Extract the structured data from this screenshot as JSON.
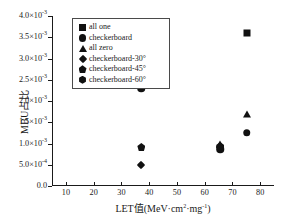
{
  "chart_data": {
    "type": "scatter",
    "title": "",
    "xlabel": "LET值(MeV·cm²·mg⁻¹)",
    "ylabel": "MBU占比",
    "xlim": [
      5,
      85
    ],
    "ylim": [
      0,
      0.004
    ],
    "grid": false,
    "legend_position": "upper-left",
    "xticks": [
      10,
      20,
      30,
      40,
      50,
      60,
      70,
      80
    ],
    "xticklabels": [
      "10",
      "20",
      "30",
      "40",
      "50",
      "60",
      "70",
      "80"
    ],
    "yticks": [
      0,
      0.0005,
      0.001,
      0.0015,
      0.002,
      0.0025,
      0.003,
      0.0035,
      0.004
    ],
    "yticklabels": [
      {
        "mant": "0.0",
        "exp": ""
      },
      {
        "mant": "5.0×10",
        "exp": "-4"
      },
      {
        "mant": "1.0×10",
        "exp": "-3"
      },
      {
        "mant": "1.5×10",
        "exp": "-3"
      },
      {
        "mant": "2.0×10",
        "exp": "-3"
      },
      {
        "mant": "2.5×10",
        "exp": "-3"
      },
      {
        "mant": "3.0×10",
        "exp": "-3"
      },
      {
        "mant": "3.5×10",
        "exp": "-3"
      },
      {
        "mant": "4.0×10",
        "exp": "-3"
      }
    ],
    "series": [
      {
        "name": "all one",
        "marker": "square",
        "points": [
          {
            "x": 75.2,
            "y": 0.0036
          }
        ]
      },
      {
        "name": "checkerboard",
        "marker": "circle",
        "points": [
          {
            "x": 37.2,
            "y": 0.0023
          },
          {
            "x": 65.6,
            "y": 0.00086
          },
          {
            "x": 75.2,
            "y": 0.00125
          }
        ]
      },
      {
        "name": "all zero",
        "marker": "triangle",
        "points": [
          {
            "x": 75.2,
            "y": 0.0017
          },
          {
            "x": 65.6,
            "y": 0.00098
          }
        ]
      },
      {
        "name": "checkerboard-30°",
        "marker": "diamond",
        "points": [
          {
            "x": 37.2,
            "y": 0.0005
          },
          {
            "x": 65.6,
            "y": 0.00092
          }
        ]
      },
      {
        "name": "checkerboard-45°",
        "marker": "pentagon",
        "points": [
          {
            "x": 37.2,
            "y": 0.00092
          },
          {
            "x": 65.6,
            "y": 0.00094
          }
        ]
      },
      {
        "name": "checkerboard-60°",
        "marker": "hexagon",
        "points": [
          {
            "x": 65.6,
            "y": 0.0009
          }
        ]
      }
    ]
  },
  "legend": {
    "entries": [
      {
        "label": "all one",
        "marker": "square"
      },
      {
        "label": "checkerboard",
        "marker": "circle"
      },
      {
        "label": "all zero",
        "marker": "triangle"
      },
      {
        "label": "checkerboard-30°",
        "marker": "diamond"
      },
      {
        "label": "checkerboard-45°",
        "marker": "pentagon"
      },
      {
        "label": "checkerboard-60°",
        "marker": "hexagon"
      }
    ]
  },
  "colors": {
    "marker": "#111111",
    "axis": "#1a1a1a",
    "background": "#ffffff"
  }
}
